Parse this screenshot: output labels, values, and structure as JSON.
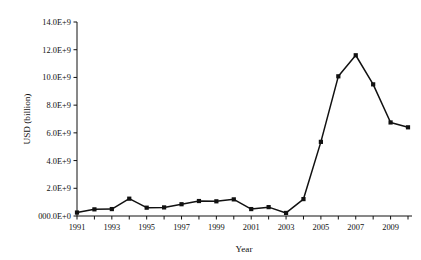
{
  "chart_data": {
    "type": "line",
    "title": "",
    "subtitle": "",
    "xlabel": "Year",
    "ylabel": "USD (billion)",
    "x": [
      1991,
      1992,
      1993,
      1994,
      1995,
      1996,
      1997,
      1998,
      1999,
      2000,
      2001,
      2002,
      2003,
      2004,
      2005,
      2006,
      2007,
      2008,
      2009,
      2010
    ],
    "values": [
      250000000,
      480000000,
      500000000,
      1250000000,
      600000000,
      620000000,
      850000000,
      1080000000,
      1060000000,
      1200000000,
      500000000,
      640000000,
      220000000,
      1220000000,
      5350000000,
      10080000000,
      11600000000,
      9500000000,
      6750000000,
      6400000000
    ],
    "series": [
      {
        "name": "USD (billion)",
        "values": [
          250000000,
          480000000,
          500000000,
          1250000000,
          600000000,
          620000000,
          850000000,
          1080000000,
          1060000000,
          1200000000,
          500000000,
          640000000,
          220000000,
          1220000000,
          5350000000,
          10080000000,
          11600000000,
          9500000000,
          6750000000,
          6400000000
        ]
      }
    ],
    "xlim": [
      1990.5,
      2010.5
    ],
    "ylim": [
      0,
      14000000000
    ],
    "ytick_values": [
      0,
      2000000000,
      4000000000,
      6000000000,
      8000000000,
      10000000000,
      12000000000,
      14000000000
    ],
    "ytick_labels": [
      "000.0E+0",
      "2.0E+9",
      "4.0E+9",
      "6.0E+9",
      "8.0E+9",
      "10.0E+9",
      "12.0E+9",
      "14.0E+9"
    ],
    "xtick_values": [
      1991,
      1992,
      1993,
      1994,
      1995,
      1996,
      1997,
      1998,
      1999,
      2000,
      2001,
      2002,
      2003,
      2004,
      2005,
      2006,
      2007,
      2008,
      2009,
      2010
    ],
    "xtick_labels": [
      "1991",
      "",
      "1993",
      "",
      "1995",
      "",
      "1997",
      "",
      "1999",
      "",
      "2001",
      "",
      "2003",
      "",
      "2005",
      "",
      "2007",
      "",
      "2009",
      ""
    ],
    "grid": false,
    "legend": false,
    "legend_position": "none",
    "marker": "square",
    "line_color": "#111111",
    "marker_color": "#111111",
    "background_color": "#ffffff"
  }
}
